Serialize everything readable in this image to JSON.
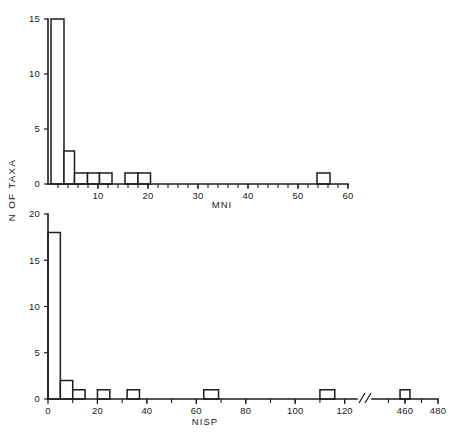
{
  "figure": {
    "background": "#ffffff",
    "ink_color": "#1c1c1c",
    "shared_y_axis_label": "N OF TAXA"
  },
  "chart_data": [
    {
      "type": "bar",
      "id": "mni-histogram",
      "title": "",
      "xlabel": "MNI",
      "ylabel": "N OF TAXA",
      "xlim": [
        0,
        60
      ],
      "ylim": [
        0,
        15
      ],
      "grid": false,
      "legend": null,
      "x_tick_labels": [
        "10",
        "20",
        "30",
        "40",
        "50",
        "60"
      ],
      "x_tick_values": [
        10,
        20,
        30,
        40,
        50,
        60
      ],
      "x_minor_tick_step": 2,
      "y_tick_labels": [
        "0",
        "5",
        "10",
        "15"
      ],
      "y_tick_values": [
        0,
        5,
        10,
        15
      ],
      "bin_width": 2.6,
      "bars": [
        {
          "x_start": 0.6,
          "x_end": 3.2,
          "value": 15
        },
        {
          "x_start": 3.2,
          "x_end": 5.3,
          "value": 3
        },
        {
          "x_start": 5.3,
          "x_end": 7.9,
          "value": 1
        },
        {
          "x_start": 7.9,
          "x_end": 10.3,
          "value": 1
        },
        {
          "x_start": 10.3,
          "x_end": 12.8,
          "value": 1
        },
        {
          "x_start": 15.4,
          "x_end": 18.0,
          "value": 1
        },
        {
          "x_start": 18.0,
          "x_end": 20.5,
          "value": 1
        },
        {
          "x_start": 53.8,
          "x_end": 56.4,
          "value": 1
        }
      ],
      "categories": [
        "0-3",
        "3-5",
        "5-8",
        "8-10",
        "10-13",
        "15-18",
        "18-21",
        "54-56"
      ],
      "values": [
        15,
        3,
        1,
        1,
        1,
        1,
        1,
        1
      ]
    },
    {
      "type": "bar",
      "id": "nisp-histogram",
      "title": "",
      "xlabel": "NISP",
      "ylabel": "N OF TAXA",
      "xlim": [
        0,
        480
      ],
      "ylim": [
        0,
        20
      ],
      "grid": false,
      "legend": null,
      "axis_break": {
        "after": 125,
        "before": 440,
        "symbol": "//"
      },
      "x_tick_labels": [
        "0",
        "20",
        "40",
        "60",
        "80",
        "100",
        "120",
        "460",
        "480"
      ],
      "x_tick_values": [
        0,
        20,
        40,
        60,
        80,
        100,
        120,
        460,
        480
      ],
      "x_minor_tick_step": 10,
      "y_tick_labels": [
        "0",
        "5",
        "10",
        "15",
        "20"
      ],
      "y_tick_values": [
        0,
        5,
        10,
        15,
        20
      ],
      "bin_width": 5,
      "bars": [
        {
          "x_start": 0,
          "x_end": 5,
          "value": 18
        },
        {
          "x_start": 5,
          "x_end": 10,
          "value": 2
        },
        {
          "x_start": 10,
          "x_end": 15,
          "value": 1
        },
        {
          "x_start": 20,
          "x_end": 25,
          "value": 1
        },
        {
          "x_start": 32,
          "x_end": 37,
          "value": 1
        },
        {
          "x_start": 63,
          "x_end": 69,
          "value": 1
        },
        {
          "x_start": 110,
          "x_end": 116,
          "value": 1
        },
        {
          "x_start": 457,
          "x_end": 463,
          "value": 1
        }
      ],
      "categories": [
        "0-5",
        "5-10",
        "10-15",
        "20-25",
        "32-37",
        "63-69",
        "110-116",
        "457-463"
      ],
      "values": [
        18,
        2,
        1,
        1,
        1,
        1,
        1,
        1
      ]
    }
  ]
}
